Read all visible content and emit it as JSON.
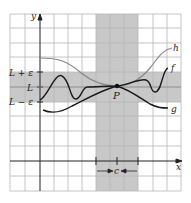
{
  "figure": {
    "type": "squeeze-theorem-epsilon-delta",
    "labels": {
      "y_axis": "y",
      "x_axis": "x",
      "L_plus_eps": "L + ε",
      "L": "L",
      "L_minus_eps": "L − ε",
      "point": "P",
      "c": "c",
      "h": "h",
      "f": "f",
      "g": "g"
    },
    "colors": {
      "background": "#ffffff",
      "grid": "#b5b5b5",
      "shade": "#c8c8c8",
      "axis": "#222222",
      "curve_h": "#8a8a8a",
      "curve_f": "#1a1a1a",
      "curve_g": "#1a1a1a",
      "text": "#222222"
    }
  }
}
